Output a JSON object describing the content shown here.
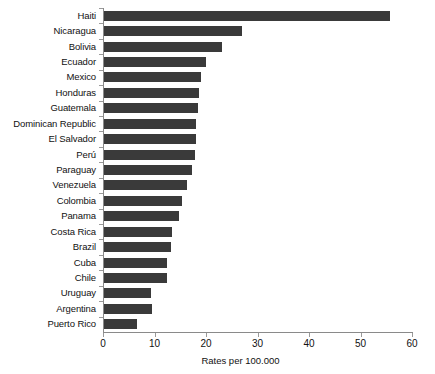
{
  "chart_data": {
    "type": "bar",
    "orientation": "horizontal",
    "title": "",
    "xlabel": "Rates per 100.000",
    "ylabel": "",
    "xlim": [
      0,
      60
    ],
    "xticks": [
      0,
      10,
      20,
      30,
      40,
      50,
      60
    ],
    "grid": false,
    "legend": null,
    "bar_color": "#3a3a3a",
    "axis_color": "#8a8a8a",
    "categories": [
      "Haiti",
      "Nicaragua",
      "Bolivia",
      "Ecuador",
      "Mexico",
      "Honduras",
      "Guatemala",
      "Dominican Republic",
      "El Salvador",
      "Perú",
      "Paraguay",
      "Venezuela",
      "Colombia",
      "Panama",
      "Costa Rica",
      "Brazil",
      "Cuba",
      "Chile",
      "Uruguay",
      "Argentina",
      "Puerto Rico"
    ],
    "values": [
      55.5,
      26.8,
      23.0,
      19.9,
      18.9,
      18.5,
      18.3,
      17.8,
      17.8,
      17.7,
      17.0,
      16.2,
      15.2,
      14.6,
      13.3,
      13.0,
      12.2,
      12.3,
      9.1,
      9.3,
      6.5
    ]
  }
}
